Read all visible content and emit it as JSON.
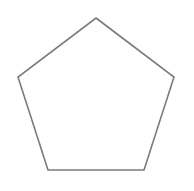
{
  "diagram": {
    "shape": "pentagon",
    "stroke_color": "#7a7a7a",
    "fill_color": "#ffffff",
    "stroke_width": 1.6,
    "vertices": [
      [
        96,
        18
      ],
      [
        174,
        77
      ],
      [
        144,
        170
      ],
      [
        48,
        170
      ],
      [
        18,
        77
      ]
    ]
  }
}
